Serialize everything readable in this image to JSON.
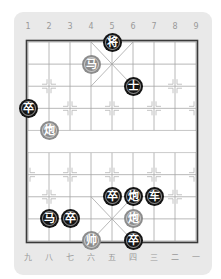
{
  "board": {
    "top_labels": [
      "1",
      "2",
      "3",
      "4",
      "5",
      "6",
      "7",
      "8",
      "9"
    ],
    "bottom_labels": [
      "九",
      "八",
      "七",
      "六",
      "五",
      "四",
      "三",
      "二",
      "一"
    ],
    "river_text": "",
    "colors": {
      "panel": "#e9e9e9",
      "board": "#ffffff",
      "grid": "#a6a6a6",
      "border": "#3a3a3a",
      "black_piece": "#141414",
      "red_piece": "#8c8c8c"
    }
  },
  "pieces": [
    {
      "char": "将",
      "side": "black",
      "name": "black-general",
      "col": 5,
      "row": 0
    },
    {
      "char": "马",
      "side": "red",
      "name": "red-horse",
      "col": 4,
      "row": 1
    },
    {
      "char": "士",
      "side": "black",
      "name": "black-advisor",
      "col": 6,
      "row": 2
    },
    {
      "char": "卒",
      "side": "black",
      "name": "black-soldier",
      "col": 1,
      "row": 3
    },
    {
      "char": "炮",
      "side": "red",
      "name": "red-cannon",
      "col": 2,
      "row": 4
    },
    {
      "char": "卒",
      "side": "black",
      "name": "black-soldier",
      "col": 5,
      "row": 7
    },
    {
      "char": "炮",
      "side": "black",
      "name": "black-cannon",
      "col": 6,
      "row": 7
    },
    {
      "char": "车",
      "side": "black",
      "name": "black-chariot",
      "col": 7,
      "row": 7
    },
    {
      "char": "马",
      "side": "black",
      "name": "black-horse",
      "col": 2,
      "row": 8
    },
    {
      "char": "卒",
      "side": "black",
      "name": "black-soldier",
      "col": 3,
      "row": 8
    },
    {
      "char": "炮",
      "side": "red",
      "name": "red-cannon",
      "col": 6,
      "row": 8
    },
    {
      "char": "帅",
      "side": "red",
      "name": "red-general",
      "col": 4,
      "row": 9
    },
    {
      "char": "卒",
      "side": "black",
      "name": "black-soldier",
      "col": 6,
      "row": 9
    }
  ]
}
